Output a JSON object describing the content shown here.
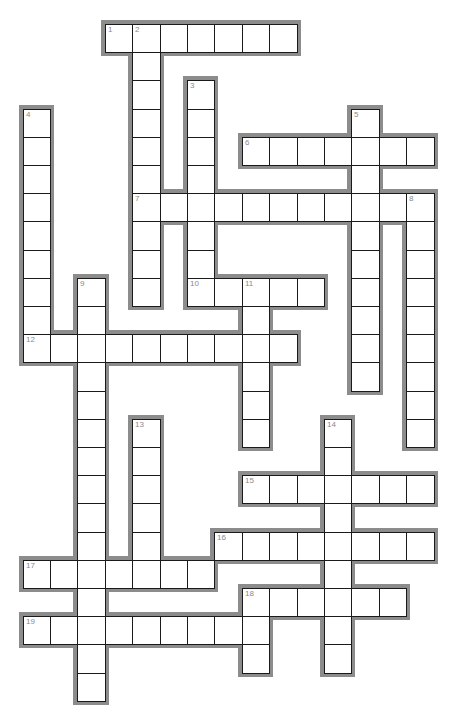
{
  "puzzle": {
    "type": "crossword",
    "grid": {
      "origin_x": 22.5,
      "origin_y": 24,
      "cell_w": 27.4,
      "cell_h": 28.2,
      "cols": 15,
      "rows": 24
    },
    "colors": {
      "outline": "#8c8c8c",
      "cell_bg": "#ffffff",
      "cell_border": "#1a1a1a",
      "number": "#8a8a8a"
    },
    "words": [
      {
        "number": 1,
        "dir": "across",
        "row": 0,
        "col": 3,
        "length": 7
      },
      {
        "number": 2,
        "dir": "down",
        "row": 0,
        "col": 4,
        "length": 10
      },
      {
        "number": 3,
        "dir": "down",
        "row": 2,
        "col": 6,
        "length": 8
      },
      {
        "number": 4,
        "dir": "down",
        "row": 3,
        "col": 0,
        "length": 9
      },
      {
        "number": 5,
        "dir": "down",
        "row": 3,
        "col": 12,
        "length": 10
      },
      {
        "number": 6,
        "dir": "across",
        "row": 4,
        "col": 8,
        "length": 7
      },
      {
        "number": 7,
        "dir": "across",
        "row": 6,
        "col": 4,
        "length": 11
      },
      {
        "number": 8,
        "dir": "down",
        "row": 6,
        "col": 14,
        "length": 9
      },
      {
        "number": 9,
        "dir": "down",
        "row": 9,
        "col": 2,
        "length": 15
      },
      {
        "number": 10,
        "dir": "across",
        "row": 9,
        "col": 6,
        "length": 5
      },
      {
        "number": 11,
        "dir": "down",
        "row": 9,
        "col": 8,
        "length": 6
      },
      {
        "number": 12,
        "dir": "across",
        "row": 11,
        "col": 0,
        "length": 10
      },
      {
        "number": 13,
        "dir": "down",
        "row": 14,
        "col": 4,
        "length": 6
      },
      {
        "number": 14,
        "dir": "down",
        "row": 14,
        "col": 11,
        "length": 9
      },
      {
        "number": 15,
        "dir": "across",
        "row": 16,
        "col": 8,
        "length": 7
      },
      {
        "number": 16,
        "dir": "across",
        "row": 18,
        "col": 7,
        "length": 8
      },
      {
        "number": 17,
        "dir": "across",
        "row": 19,
        "col": 0,
        "length": 7
      },
      {
        "number": 18,
        "dir": "across",
        "row": 20,
        "col": 8,
        "length": 6
      },
      {
        "number": 18,
        "dir": "down",
        "row": 20,
        "col": 8,
        "length": 3
      },
      {
        "number": 19,
        "dir": "across",
        "row": 21,
        "col": 0,
        "length": 9
      }
    ]
  }
}
